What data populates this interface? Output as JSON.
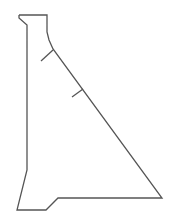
{
  "diagram": {
    "type": "gravity-dam-cross-section",
    "stroke_color": "#555555",
    "background": "#ffffff",
    "outline_points": "19,15 47,15 47,32 49,40 53,49 162,198 58,198 46,210 17,210 27,170 27,25 19,18 19,15",
    "ticks": [
      {
        "x1": 53,
        "y1": 50,
        "x2": 41,
        "y2": 61
      },
      {
        "x1": 83,
        "y1": 89,
        "x2": 72,
        "y2": 97
      }
    ]
  }
}
